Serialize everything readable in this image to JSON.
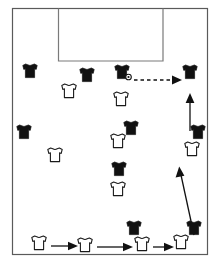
{
  "diagram": {
    "type": "football-pitch-play-diagram",
    "canvas": {
      "width": 219,
      "height": 263
    },
    "colors": {
      "background": "#ffffff",
      "field_border": "#5a5a5a",
      "goal_area_line": "#7a7a7a",
      "dark_team": "#111111",
      "light_team": "#ffffff",
      "light_team_outline": "#1a1a1a",
      "arrow": "#111111"
    },
    "field": {
      "border": {
        "x": 12,
        "y": 8,
        "width": 196,
        "height": 247
      },
      "goal_area": {
        "x": 58,
        "y": 8,
        "width": 105,
        "height": 53,
        "label": "penalty-area"
      }
    },
    "teams": {
      "dark_label": "Defending team (dark jerseys)",
      "light_label": "Attacking team (white jerseys)",
      "dark_count": 9,
      "light_count": 10
    },
    "players_dark": [
      {
        "id": "D1",
        "x": 30,
        "y": 71
      },
      {
        "id": "D2",
        "x": 87,
        "y": 75
      },
      {
        "id": "D3",
        "x": 122,
        "y": 72,
        "has_ball": true
      },
      {
        "id": "D4",
        "x": 190,
        "y": 72
      },
      {
        "id": "D5",
        "x": 24,
        "y": 132
      },
      {
        "id": "D6",
        "x": 131,
        "y": 128
      },
      {
        "id": "D7",
        "x": 198,
        "y": 132
      },
      {
        "id": "D8",
        "x": 119,
        "y": 169
      },
      {
        "id": "D9",
        "x": 134,
        "y": 228
      },
      {
        "id": "D10",
        "x": 194,
        "y": 228
      }
    ],
    "players_light": [
      {
        "id": "L1",
        "x": 69,
        "y": 91
      },
      {
        "id": "L2",
        "x": 121,
        "y": 99
      },
      {
        "id": "L3",
        "x": 118,
        "y": 141
      },
      {
        "id": "L4",
        "x": 55,
        "y": 155
      },
      {
        "id": "L5",
        "x": 192,
        "y": 149
      },
      {
        "id": "L6",
        "x": 118,
        "y": 189
      },
      {
        "id": "L7",
        "x": 39,
        "y": 243,
        "has_ball": false
      },
      {
        "id": "L8",
        "x": 85,
        "y": 245
      },
      {
        "id": "L9",
        "x": 142,
        "y": 244
      },
      {
        "id": "L10",
        "x": 181,
        "y": 242
      }
    ],
    "ball": {
      "x": 128,
      "y": 76,
      "label": "ball-at-dark-player"
    },
    "arrows": [
      {
        "id": "A1",
        "style": "dashed",
        "label": "pass-right",
        "x1": 133,
        "y1": 80,
        "x2": 181,
        "y2": 80
      },
      {
        "id": "A2",
        "style": "solid",
        "label": "run-up-right-upper",
        "x1": 190,
        "y1": 130,
        "x2": 190,
        "y2": 95
      },
      {
        "id": "A3",
        "style": "solid",
        "label": "run-up-right-lower",
        "x1": 193,
        "y1": 234,
        "x2": 180,
        "y2": 165
      },
      {
        "id": "A4",
        "style": "solid",
        "label": "pass-bottom-1",
        "x1": 52,
        "y1": 246,
        "x2": 76,
        "y2": 246
      },
      {
        "id": "A5",
        "style": "solid",
        "label": "pass-bottom-2",
        "x1": 97,
        "y1": 247,
        "x2": 131,
        "y2": 247
      },
      {
        "id": "A6",
        "style": "solid",
        "label": "pass-bottom-3",
        "x1": 153,
        "y1": 247,
        "x2": 172,
        "y2": 247
      }
    ]
  }
}
